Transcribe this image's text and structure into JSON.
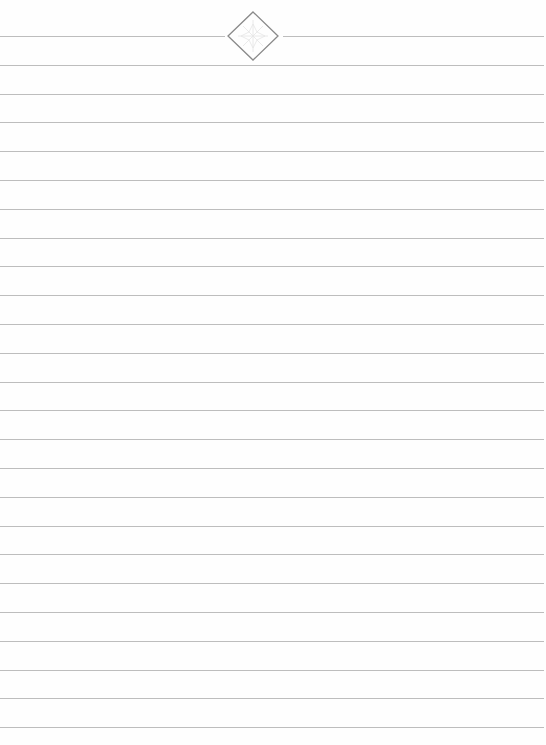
{
  "page": {
    "type": "lined-paper",
    "background_color": "#fefefe",
    "line_color": "#bdbdbd",
    "ornament_color": "#8a8a8a",
    "ornament_fill_pattern_color": "#e6e6e6",
    "line_count": 25,
    "first_line_y": 36,
    "line_spacing": 28.8
  },
  "ornament": {
    "icon": "diamond-ornament-icon"
  }
}
